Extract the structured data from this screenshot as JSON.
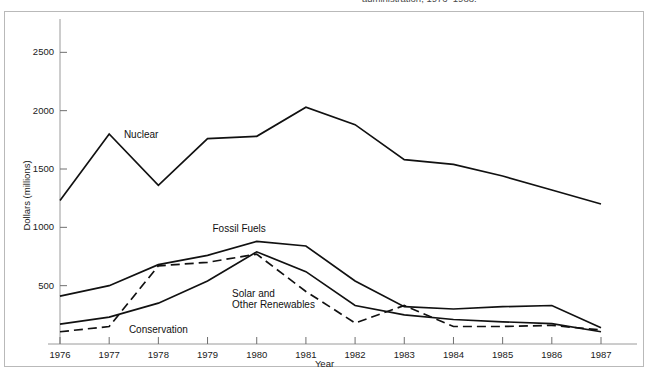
{
  "figure": {
    "caption_fragment": "administration, 1976–1988.",
    "background_color": "#ffffff",
    "frame_color": "#b9b9b9",
    "line_color": "#111111"
  },
  "chart_data": {
    "type": "line",
    "title": "",
    "xlabel": "Year",
    "ylabel": "Dollars (millions)",
    "x": [
      1976,
      1977,
      1978,
      1979,
      1980,
      1981,
      1982,
      1983,
      1984,
      1985,
      1986,
      1987
    ],
    "xlim": [
      1976,
      1987
    ],
    "ylim": [
      0,
      2700
    ],
    "ytick_values": [
      500,
      1000,
      1500,
      2000,
      2500
    ],
    "ytick_labels": [
      "500",
      "1000",
      "1500",
      "2000",
      "2500"
    ],
    "xtick_labels": [
      "1976",
      "1977",
      "1978",
      "1979",
      "1980",
      "1981",
      "1982",
      "1983",
      "1984",
      "1985",
      "1986",
      "1987"
    ],
    "grid": false,
    "legend": "inline-annotations",
    "series": [
      {
        "name": "Nuclear",
        "style": "solid",
        "label_x": 1977.3,
        "label_y": 1790,
        "values": [
          1230,
          1800,
          1360,
          1760,
          1780,
          2030,
          1880,
          1580,
          1540,
          1440,
          1320,
          1200
        ]
      },
      {
        "name": "Fossil Fuels",
        "style": "solid",
        "label_x": 1979.1,
        "label_y": 990,
        "values": [
          410,
          500,
          680,
          760,
          880,
          840,
          540,
          320,
          300,
          320,
          330,
          140
        ]
      },
      {
        "name": "Solar and\nOther Renewables",
        "style": "solid",
        "label_x": 1979.5,
        "label_y": 430,
        "values": [
          170,
          230,
          350,
          540,
          790,
          620,
          330,
          250,
          210,
          190,
          175,
          105
        ]
      },
      {
        "name": "Conservation",
        "style": "dashed",
        "label_x": 1977.4,
        "label_y": 120,
        "values": [
          105,
          150,
          670,
          700,
          770,
          450,
          180,
          330,
          150,
          150,
          160,
          120
        ]
      }
    ],
    "annotations": [
      {
        "text": "Nuclear",
        "kind": "series-label"
      },
      {
        "text": "Fossil Fuels",
        "kind": "series-label"
      },
      {
        "text": "Solar and",
        "kind": "series-label"
      },
      {
        "text": "Other Renewables",
        "kind": "series-label"
      },
      {
        "text": "Conservation",
        "kind": "series-label"
      }
    ]
  }
}
